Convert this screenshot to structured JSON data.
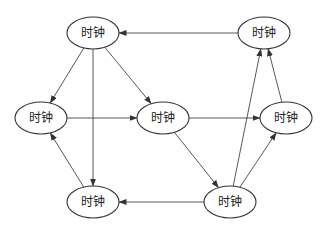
{
  "diagram": {
    "type": "directed-graph",
    "colors": {
      "stroke": "#333333",
      "text": "#222222",
      "background": "#ffffff"
    },
    "nodes": [
      {
        "id": "A",
        "label": "时钟",
        "cx": 93,
        "cy": 33,
        "rx": 26,
        "ry": 16
      },
      {
        "id": "B",
        "label": "时钟",
        "cx": 264,
        "cy": 33,
        "rx": 26,
        "ry": 16
      },
      {
        "id": "C",
        "label": "时钟",
        "cx": 41,
        "cy": 118,
        "rx": 26,
        "ry": 16
      },
      {
        "id": "D",
        "label": "时钟",
        "cx": 163,
        "cy": 118,
        "rx": 26,
        "ry": 16
      },
      {
        "id": "E",
        "label": "时钟",
        "cx": 286,
        "cy": 118,
        "rx": 26,
        "ry": 16
      },
      {
        "id": "F",
        "label": "时钟",
        "cx": 93,
        "cy": 202,
        "rx": 26,
        "ry": 16
      },
      {
        "id": "G",
        "label": "时钟",
        "cx": 230,
        "cy": 202,
        "rx": 26,
        "ry": 16
      }
    ],
    "edges": [
      {
        "from": "B",
        "to": "A"
      },
      {
        "from": "A",
        "to": "C"
      },
      {
        "from": "A",
        "to": "D"
      },
      {
        "from": "A",
        "to": "F"
      },
      {
        "from": "C",
        "to": "D"
      },
      {
        "from": "D",
        "to": "E"
      },
      {
        "from": "D",
        "to": "G"
      },
      {
        "from": "F",
        "to": "C"
      },
      {
        "from": "G",
        "to": "F"
      },
      {
        "from": "G",
        "to": "B"
      },
      {
        "from": "G",
        "to": "E"
      },
      {
        "from": "E",
        "to": "B"
      }
    ]
  }
}
